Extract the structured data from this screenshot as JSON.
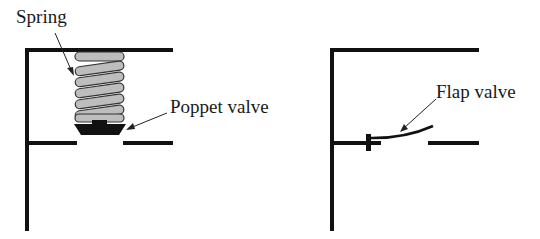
{
  "diagrams": [
    {
      "name": "poppet-valve-diagram",
      "labels": {
        "spring": "Spring",
        "valve": "Poppet valve"
      }
    },
    {
      "name": "flap-valve-diagram",
      "labels": {
        "valve": "Flap valve"
      }
    }
  ],
  "colors": {
    "line": "#111111",
    "spring_fill": "#bdbdbd",
    "spring_stroke": "#333333"
  }
}
